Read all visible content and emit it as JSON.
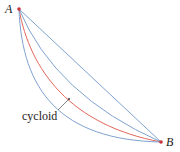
{
  "diagram": {
    "points": [
      {
        "label": "A",
        "x": 19,
        "y": 9
      },
      {
        "label": "B",
        "x": 161,
        "y": 142
      }
    ],
    "curves": [
      {
        "name": "straight-line",
        "color": "#7fa3cf"
      },
      {
        "name": "shallow-curve",
        "color": "#7fa3cf"
      },
      {
        "name": "cycloid",
        "color": "#e0685a"
      },
      {
        "name": "deep-curve",
        "color": "#7fa3cf"
      }
    ],
    "annotation": {
      "label": "cycloid"
    },
    "colors": {
      "blue": "#7fa3cf",
      "red": "#e0685a",
      "point": "#c8323a",
      "text": "#222222"
    }
  }
}
